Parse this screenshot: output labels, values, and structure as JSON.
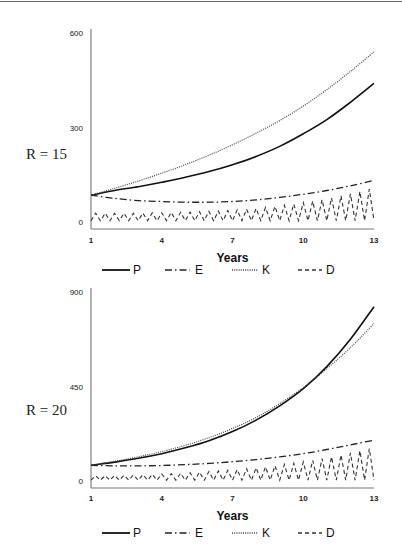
{
  "chart_data": [
    {
      "type": "line",
      "panel_label": "R = 15",
      "title": "",
      "xlabel": "Years",
      "ylabel": "",
      "x_ticks": [
        1,
        4,
        7,
        10,
        13
      ],
      "y_ticks": [
        0,
        300,
        600
      ],
      "xlim": [
        1,
        13
      ],
      "ylim": [
        0,
        600
      ],
      "grid": false,
      "legend_position": "bottom",
      "x": [
        1,
        2,
        3,
        4,
        5,
        6,
        7,
        8,
        9,
        10,
        11,
        12,
        13
      ],
      "series": [
        {
          "name": "P",
          "style": "solid",
          "values": [
            85,
            100,
            112,
            126,
            142,
            160,
            182,
            208,
            240,
            280,
            325,
            380,
            440
          ]
        },
        {
          "name": "E",
          "style": "dash-dot",
          "values": [
            85,
            75,
            68,
            65,
            63,
            63,
            65,
            70,
            78,
            88,
            100,
            115,
            132
          ]
        },
        {
          "name": "K",
          "style": "dotted",
          "values": [
            85,
            107,
            130,
            155,
            182,
            212,
            245,
            282,
            322,
            368,
            420,
            478,
            540
          ]
        },
        {
          "name": "D",
          "style": "dashed",
          "values": [
            50,
            10,
            25,
            15,
            35,
            20,
            45,
            25,
            60,
            30,
            75,
            35,
            120
          ]
        }
      ]
    },
    {
      "type": "line",
      "panel_label": "R = 20",
      "title": "",
      "xlabel": "Years",
      "ylabel": "",
      "x_ticks": [
        1,
        4,
        7,
        10,
        13
      ],
      "y_ticks": [
        0,
        450,
        900
      ],
      "xlim": [
        1,
        13
      ],
      "ylim": [
        0,
        900
      ],
      "grid": false,
      "legend_position": "bottom",
      "x": [
        1,
        2,
        3,
        4,
        5,
        6,
        7,
        8,
        9,
        10,
        11,
        12,
        13
      ],
      "series": [
        {
          "name": "P",
          "style": "solid",
          "values": [
            75,
            90,
            108,
            130,
            158,
            192,
            235,
            290,
            358,
            440,
            545,
            675,
            830
          ]
        },
        {
          "name": "E",
          "style": "dash-dot",
          "values": [
            75,
            72,
            72,
            74,
            78,
            84,
            92,
            102,
            115,
            130,
            150,
            172,
            195
          ]
        },
        {
          "name": "K",
          "style": "dotted",
          "values": [
            75,
            94,
            115,
            140,
            170,
            206,
            250,
            302,
            368,
            445,
            535,
            635,
            750
          ]
        },
        {
          "name": "D",
          "style": "dashed",
          "values": [
            40,
            5,
            25,
            10,
            35,
            15,
            55,
            25,
            80,
            35,
            110,
            40,
            170
          ]
        }
      ]
    }
  ],
  "legend": [
    {
      "name": "P",
      "label": "P"
    },
    {
      "name": "E",
      "label": "E"
    },
    {
      "name": "K",
      "label": "K"
    },
    {
      "name": "D",
      "label": "D"
    }
  ]
}
